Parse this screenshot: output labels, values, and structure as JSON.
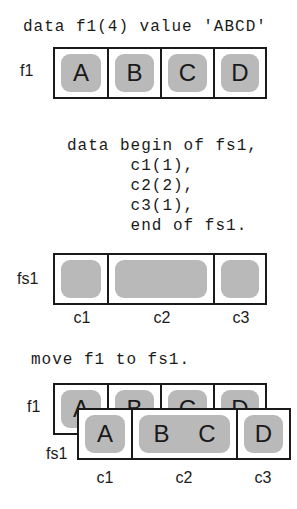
{
  "section1": {
    "statement": "data f1(4) value 'ABCD'",
    "field_label": "f1",
    "cells": [
      "A",
      "B",
      "C",
      "D"
    ]
  },
  "section2": {
    "code_lines": [
      "data begin of fs1,",
      "      c1(1),",
      "      c2(2),",
      "      c3(1),",
      "      end of fs1."
    ],
    "field_label": "fs1",
    "components": [
      {
        "name": "c1",
        "length": 1
      },
      {
        "name": "c2",
        "length": 2
      },
      {
        "name": "c3",
        "length": 1
      }
    ]
  },
  "section3": {
    "statement": "move f1 to fs1.",
    "f1_label": "f1",
    "f1_cells": [
      "A",
      "B",
      "C",
      "D"
    ],
    "fs1_label": "fs1",
    "fs1_cells": [
      [
        "A"
      ],
      [
        "B",
        "C"
      ],
      [
        "D"
      ]
    ],
    "component_labels": [
      "c1",
      "c2",
      "c3"
    ]
  },
  "colors": {
    "border": "#1a1a1a",
    "slot_fill": "#b9b9b9",
    "background": "#ffffff"
  }
}
